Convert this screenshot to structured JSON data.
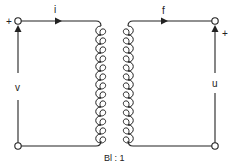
{
  "diagram": {
    "type": "gyrator-transformer equivalent circuit",
    "left_port": {
      "plus_label": "+",
      "voltage_label": "v",
      "current_label": "i"
    },
    "right_port": {
      "plus_label": "+",
      "voltage_label": "u",
      "current_label": "f"
    },
    "ratio_label": "Bl : 1",
    "colors": {
      "line": "#222222",
      "background": "#ffffff"
    }
  }
}
